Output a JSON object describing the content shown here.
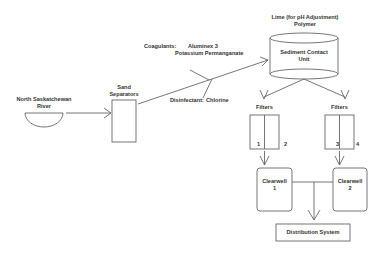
{
  "diagram": {
    "nodes": {
      "river": {
        "line1": "North Saskatchewan",
        "line2": "River"
      },
      "sand": {
        "line1": "Sand",
        "line2": "Separators"
      },
      "sediment": {
        "line1": "Sediment Contact",
        "line2": "Unit"
      },
      "lime": {
        "line1": "Lime (for pH Adjustment)",
        "line2": "Polymer"
      },
      "filters_left": {
        "label": "Filters",
        "num_a": "1",
        "num_b": "2"
      },
      "filters_right": {
        "label": "Filters",
        "num_a": "3",
        "num_b": "4"
      },
      "clearwell1": {
        "line1": "Clearwell",
        "line2": "1"
      },
      "clearwell2": {
        "line1": "Clearwell",
        "line2": "2"
      },
      "distribution": {
        "label": "Distribution System"
      }
    },
    "annotations": {
      "coagulants_label": "Coagulants:",
      "coagulant_1": "Aluminex 3",
      "coagulant_2": "Potassium Permanganate",
      "disinfectant_label": "Disinfectant:",
      "disinfectant_value": "Chlorine"
    },
    "colors": {
      "stroke": "#555555",
      "text": "#333333",
      "background": "#ffffff"
    }
  }
}
